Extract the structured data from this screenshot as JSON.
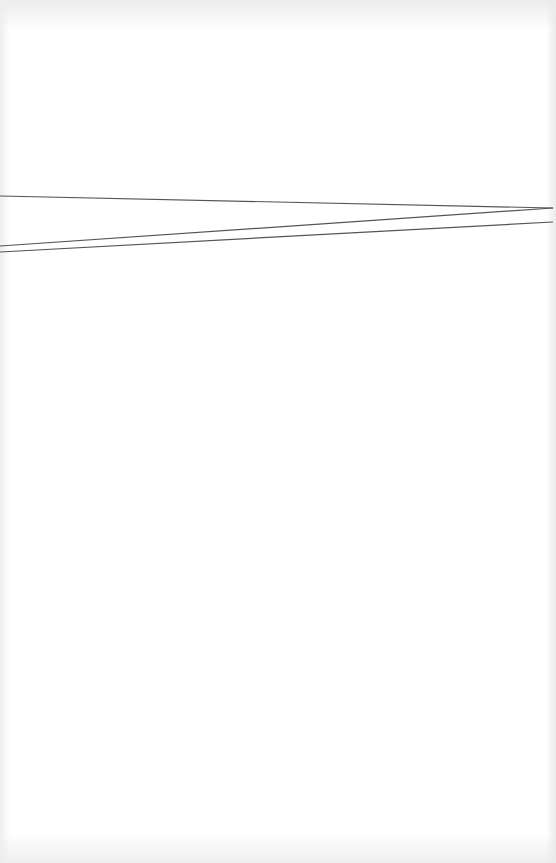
{
  "document": {
    "type": "scanned blank page",
    "background_color": "#ffffff",
    "line_color": "#555555",
    "lines": [
      {
        "id": "line-a",
        "x1": 0,
        "y1": 196,
        "x2": 553,
        "y2": 208
      },
      {
        "id": "line-b",
        "x1": 0,
        "y1": 246,
        "x2": 553,
        "y2": 208
      },
      {
        "id": "line-c",
        "x1": 0,
        "y1": 252,
        "x2": 553,
        "y2": 222
      }
    ]
  }
}
